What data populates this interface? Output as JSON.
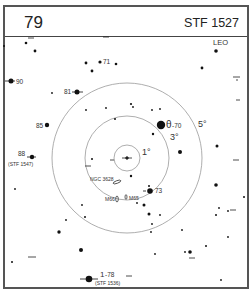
{
  "header": {
    "chart_number": "79",
    "chart_title": "STF 1527"
  },
  "constellation": "LEO",
  "rings": [
    {
      "label": "1°",
      "radius": 13
    },
    {
      "label": "3°",
      "radius": 42
    },
    {
      "label": "5°",
      "radius": 75
    }
  ],
  "center": {
    "x": 127,
    "y": 158
  },
  "labels": {
    "star_71": "71",
    "star_90": "90",
    "star_81": "81",
    "star_85": "85",
    "star_88": "88",
    "star_88_sub": "(STF 1547)",
    "theta": "θ",
    "theta_num": "-70",
    "star_73": "73",
    "star_78_prefix": "1",
    "star_78": "-78",
    "star_78_sub": "(STF 1536)",
    "ngc": "NGC 3628",
    "m66": "M66",
    "m65": "M65",
    "ring_1": "1°",
    "ring_3": "3°",
    "ring_5": "5°"
  }
}
